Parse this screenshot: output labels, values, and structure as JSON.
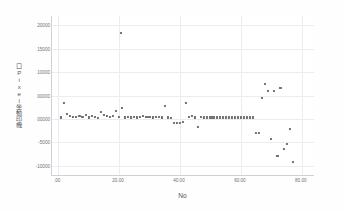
{
  "chart_data": {
    "type": "scatter",
    "title": "",
    "xlabel": "No",
    "ylabel": "口Pixel坐動印機",
    "xlim": [
      -2,
      84
    ],
    "ylim": [
      -12000,
      22000
    ],
    "grid": true,
    "legend": null,
    "marker": {
      "shape": "square",
      "color": "#6e7276",
      "size": 2.1
    },
    "xticks": [
      0,
      20,
      40,
      60,
      80
    ],
    "xtick_labels": [
      ".00",
      "20.00",
      "40.00",
      "60.00",
      "80.00"
    ],
    "yticks": [
      20000,
      15000,
      10000,
      5000,
      0,
      -5000,
      -10000
    ],
    "ytick_labels": [
      "20000",
      "15000",
      "10000",
      "00000",
      "00000",
      "-5000",
      "-10000"
    ],
    "x": [
      1,
      2,
      3,
      4,
      5,
      6,
      7,
      8,
      9,
      10,
      11,
      12,
      13,
      14,
      15,
      16,
      17,
      18,
      19,
      20,
      20.5,
      21,
      22,
      23,
      24,
      25,
      26,
      27,
      28,
      29,
      30,
      31,
      32,
      33,
      34,
      35,
      36,
      37,
      38,
      39,
      40,
      41,
      42,
      43,
      44,
      45,
      46,
      47,
      48,
      49,
      50,
      51,
      52,
      53,
      54,
      55,
      56,
      57,
      58,
      59,
      60,
      61,
      62,
      63,
      64,
      65,
      66,
      67,
      68,
      69,
      70,
      71,
      72,
      73,
      74,
      75,
      76,
      77
    ],
    "y": [
      300,
      3400,
      1100,
      700,
      500,
      400,
      600,
      500,
      900,
      300,
      700,
      500,
      200,
      1400,
      900,
      600,
      400,
      700,
      1600,
      400,
      18400,
      2400,
      300,
      400,
      300,
      500,
      300,
      400,
      600,
      500,
      400,
      300,
      500,
      400,
      300,
      2700,
      300,
      200,
      -900,
      -900,
      -800,
      -700,
      3500,
      500,
      700,
      300,
      -1800,
      400,
      300,
      300,
      300,
      300,
      300,
      300,
      300,
      300,
      300,
      300,
      300,
      300,
      300,
      300,
      300,
      300,
      300,
      -3100,
      -3100,
      4400,
      7400,
      5900,
      -4200,
      6000,
      -8000,
      6700,
      -6400,
      -5300,
      -2200,
      -9200
    ],
    "series": [
      {
        "name": "Residual",
        "points": [
          [
            1,
            300
          ],
          [
            2,
            3400
          ],
          [
            3,
            1100
          ],
          [
            4,
            700
          ],
          [
            5,
            500
          ],
          [
            6,
            400
          ],
          [
            7,
            600
          ],
          [
            8,
            500
          ],
          [
            9,
            900
          ],
          [
            10,
            300
          ],
          [
            11,
            700
          ],
          [
            12,
            500
          ],
          [
            13,
            200
          ],
          [
            14,
            1400
          ],
          [
            15,
            900
          ],
          [
            16,
            600
          ],
          [
            17,
            400
          ],
          [
            18,
            700
          ],
          [
            19,
            1600
          ],
          [
            20,
            400
          ],
          [
            20.5,
            18400
          ],
          [
            21,
            2400
          ],
          [
            22,
            300
          ],
          [
            23,
            400
          ],
          [
            24,
            300
          ],
          [
            25,
            500
          ],
          [
            26,
            300
          ],
          [
            27,
            400
          ],
          [
            28,
            600
          ],
          [
            29,
            500
          ],
          [
            30,
            400
          ],
          [
            31,
            300
          ],
          [
            32,
            500
          ],
          [
            33,
            400
          ],
          [
            34,
            300
          ],
          [
            35,
            2700
          ],
          [
            36,
            300
          ],
          [
            37,
            200
          ],
          [
            38,
            -900
          ],
          [
            39,
            -900
          ],
          [
            40,
            -800
          ],
          [
            41,
            -700
          ],
          [
            42,
            3500
          ],
          [
            43,
            500
          ],
          [
            44,
            700
          ],
          [
            45,
            300
          ],
          [
            46,
            -1800
          ],
          [
            47,
            400
          ],
          [
            48,
            300
          ],
          [
            49,
            300
          ],
          [
            50,
            300
          ],
          [
            51,
            300
          ],
          [
            52,
            300
          ],
          [
            53,
            300
          ],
          [
            54,
            300
          ],
          [
            55,
            300
          ],
          [
            56,
            300
          ],
          [
            57,
            300
          ],
          [
            58,
            300
          ],
          [
            59,
            300
          ],
          [
            60,
            300
          ],
          [
            61,
            300
          ],
          [
            62,
            300
          ],
          [
            63,
            300
          ],
          [
            64,
            300
          ],
          [
            65,
            -3100
          ],
          [
            66,
            -3100
          ],
          [
            67,
            4400
          ],
          [
            68,
            7400
          ],
          [
            69,
            5900
          ],
          [
            70,
            -4200
          ],
          [
            71,
            6000
          ],
          [
            72,
            -8000
          ],
          [
            73,
            6700
          ],
          [
            74,
            -6400
          ],
          [
            75,
            -5300
          ],
          [
            76,
            -2200
          ],
          [
            77,
            -9200
          ]
        ]
      }
    ]
  }
}
